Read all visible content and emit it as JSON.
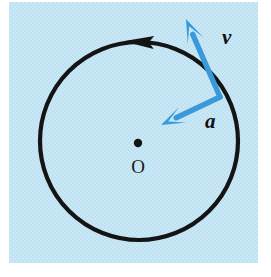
{
  "figure": {
    "kind": "physics-diagram",
    "background_color": "#ffffff",
    "panel": {
      "fill_color": "#bfe2f2",
      "x": 9,
      "y": 2,
      "width": 249,
      "height": 261
    },
    "circle": {
      "stroke_color": "#141414",
      "stroke_width": 4.2,
      "center_x": 139,
      "center_y": 141,
      "radius": 99,
      "direction": "counterclockwise",
      "direction_arrow_label": "motion-direction-arrowhead"
    },
    "center_point": {
      "label": "O",
      "dot_color": "#141414",
      "dot_x": 138,
      "dot_y": 143,
      "dot_radius": 4.2,
      "label_x": 138,
      "label_y": 170
    },
    "vectors": [
      {
        "name": "velocity",
        "label": "v",
        "color": "#3a9ad9",
        "origin_x": 220,
        "origin_y": 97,
        "tip_x": 186,
        "tip_y": 19,
        "label_x": 222,
        "label_y": 44,
        "description": "tangential velocity vector"
      },
      {
        "name": "acceleration",
        "label": "a",
        "color": "#3a9ad9",
        "origin_x": 220,
        "origin_y": 97,
        "tip_x": 161,
        "tip_y": 125,
        "label_x": 205,
        "label_y": 128,
        "description": "centripetal acceleration vector pointing toward center"
      }
    ]
  }
}
